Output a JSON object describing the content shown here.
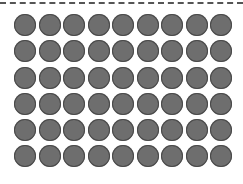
{
  "grid": {
    "rows": 6,
    "columns": 9,
    "total": 54,
    "dot_color": "#6e6e6e",
    "outline_color": "#4a4a4a"
  },
  "divider": {
    "style": "dashed",
    "color": "#555555"
  }
}
